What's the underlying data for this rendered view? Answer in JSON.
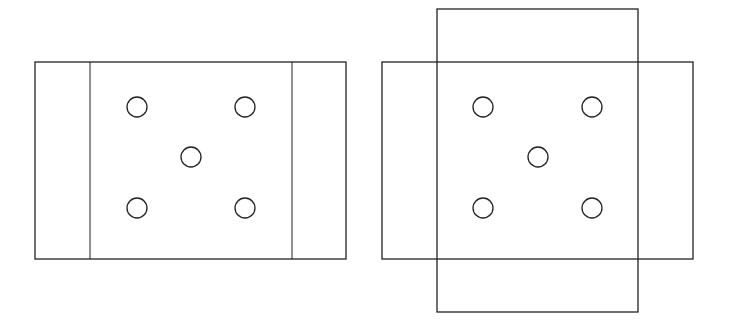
{
  "diagram": {
    "stroke_color": "#222222",
    "background": "#ffffff",
    "figures": [
      {
        "name": "left-figure",
        "rects": [
          {
            "x": 35,
            "y": 62,
            "w": 311,
            "h": 197
          }
        ],
        "lines": [
          {
            "x1": 90,
            "y1": 62,
            "x2": 90,
            "y2": 259
          },
          {
            "x1": 292,
            "y1": 62,
            "x2": 292,
            "y2": 259
          }
        ],
        "circles": [
          {
            "cx": 137,
            "cy": 107
          },
          {
            "cx": 245,
            "cy": 107
          },
          {
            "cx": 191,
            "cy": 157
          },
          {
            "cx": 137,
            "cy": 208
          },
          {
            "cx": 245,
            "cy": 208
          }
        ]
      },
      {
        "name": "right-figure",
        "rects": [
          {
            "x": 382,
            "y": 62,
            "w": 311,
            "h": 197
          },
          {
            "x": 437,
            "y": 9,
            "w": 201,
            "h": 303
          }
        ],
        "lines": [],
        "circles": [
          {
            "cx": 483,
            "cy": 107
          },
          {
            "cx": 592,
            "cy": 107
          },
          {
            "cx": 538,
            "cy": 157
          },
          {
            "cx": 483,
            "cy": 208
          },
          {
            "cx": 592,
            "cy": 208
          }
        ]
      }
    ],
    "circle_radius": 10
  }
}
